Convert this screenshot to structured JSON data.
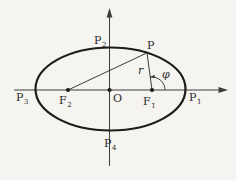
{
  "figure": {
    "type": "geometry-diagram",
    "colors": {
      "paper": "#f5f4f1",
      "curve-ink": "#1c1c1c",
      "line-ink": "#3c3c3c",
      "text-ink": "#2a2a2a"
    },
    "labels": {
      "point_on_curve": "P",
      "origin": "O",
      "radius": "r",
      "angle": "φ",
      "vertex_right": {
        "base": "P",
        "sub": "1"
      },
      "vertex_top": {
        "base": "P",
        "sub": "2"
      },
      "vertex_left": {
        "base": "P",
        "sub": "3"
      },
      "vertex_bottom": {
        "base": "P",
        "sub": "4"
      },
      "focus_right": {
        "base": "F",
        "sub": "1"
      },
      "focus_left": {
        "base": "F",
        "sub": "2"
      }
    }
  }
}
